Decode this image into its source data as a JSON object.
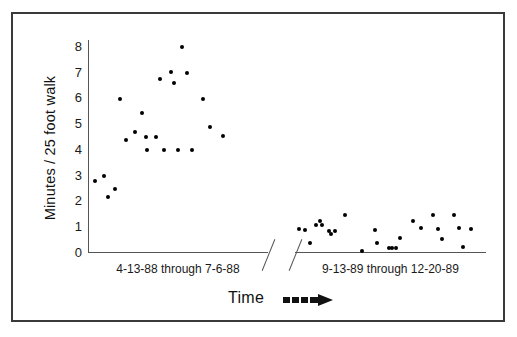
{
  "chart_data": {
    "type": "scatter",
    "title": "",
    "xlabel": "Time",
    "ylabel": "Minutes / 25 foot walk",
    "ylim": [
      0,
      8
    ],
    "yticks": [
      0,
      1,
      2,
      3,
      4,
      5,
      6,
      7,
      8
    ],
    "ytick_labels": [
      "0",
      "1",
      "2",
      "3",
      "4",
      "5",
      "6",
      "7",
      "8"
    ],
    "grid": false,
    "legend": "none",
    "axis_break": true,
    "marker_color": "#000000",
    "axis_color": "#555555",
    "frame_color": "#3a3a3a",
    "x_axis_arrow_label": "Time",
    "x_groups": [
      {
        "name": "period-1",
        "label": "4-13-88  through  7-6-88",
        "points": [
          {
            "x": 0.04,
            "y": 2.75
          },
          {
            "x": 0.09,
            "y": 2.95
          },
          {
            "x": 0.11,
            "y": 2.15
          },
          {
            "x": 0.15,
            "y": 2.45
          },
          {
            "x": 0.18,
            "y": 5.95
          },
          {
            "x": 0.21,
            "y": 4.35
          },
          {
            "x": 0.26,
            "y": 4.65
          },
          {
            "x": 0.3,
            "y": 5.4
          },
          {
            "x": 0.32,
            "y": 4.45
          },
          {
            "x": 0.33,
            "y": 3.95
          },
          {
            "x": 0.38,
            "y": 4.45
          },
          {
            "x": 0.4,
            "y": 6.7
          },
          {
            "x": 0.42,
            "y": 3.95
          },
          {
            "x": 0.46,
            "y": 7.0
          },
          {
            "x": 0.48,
            "y": 6.55
          },
          {
            "x": 0.5,
            "y": 3.95
          },
          {
            "x": 0.52,
            "y": 7.95
          },
          {
            "x": 0.55,
            "y": 6.95
          },
          {
            "x": 0.58,
            "y": 3.95
          },
          {
            "x": 0.64,
            "y": 5.95
          },
          {
            "x": 0.68,
            "y": 4.85
          },
          {
            "x": 0.75,
            "y": 4.5
          }
        ]
      },
      {
        "name": "period-2",
        "label": "9-13-89  through  12-20-89",
        "points": [
          {
            "x": 0.05,
            "y": 0.85
          },
          {
            "x": 0.08,
            "y": 0.35
          },
          {
            "x": 0.11,
            "y": 1.05
          },
          {
            "x": 0.13,
            "y": 1.2
          },
          {
            "x": 0.14,
            "y": 1.05
          },
          {
            "x": 0.18,
            "y": 0.8
          },
          {
            "x": 0.19,
            "y": 0.7
          },
          {
            "x": 0.21,
            "y": 0.8
          },
          {
            "x": 0.26,
            "y": 1.45
          },
          {
            "x": 0.42,
            "y": 0.85
          },
          {
            "x": 0.43,
            "y": 0.35
          },
          {
            "x": 0.49,
            "y": 0.15
          },
          {
            "x": 0.51,
            "y": 0.15
          },
          {
            "x": 0.53,
            "y": 0.15
          },
          {
            "x": 0.55,
            "y": 0.55
          },
          {
            "x": 0.62,
            "y": 1.2
          },
          {
            "x": 0.66,
            "y": 0.95
          },
          {
            "x": 0.72,
            "y": 1.45
          },
          {
            "x": 0.75,
            "y": 0.9
          },
          {
            "x": 0.77,
            "y": 0.5
          },
          {
            "x": 0.83,
            "y": 1.45
          },
          {
            "x": 0.86,
            "y": 0.95
          },
          {
            "x": 0.88,
            "y": 0.2
          },
          {
            "x": 0.92,
            "y": 0.9
          },
          {
            "x": 0.02,
            "y": 0.9
          },
          {
            "x": 0.35,
            "y": 0.05
          }
        ]
      }
    ]
  },
  "axes": {
    "y_title": "Minutes / 25 foot walk",
    "x_title": "Time"
  }
}
